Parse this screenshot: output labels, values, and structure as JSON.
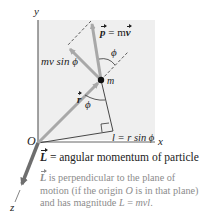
{
  "diagram": {
    "axes": {
      "x_label": "x",
      "y_label": "y",
      "z_label": "z",
      "origin_label": "O"
    },
    "particle_label": "m",
    "labels": {
      "momentum_lhs": "p",
      "momentum_eq": " = m",
      "momentum_rhs": "v",
      "perp_component": "mv sin ϕ",
      "angle_upper": "ϕ",
      "angle_lower": "ϕ",
      "position_vector": "r",
      "lever_arm_l": "l",
      "lever_arm_eq": " = r sin ϕ"
    },
    "colors": {
      "plane_fill": "#efefef",
      "arrow_gray": "#a8a8a8",
      "L_arrow": "#6e6e6e",
      "line": "#333333",
      "caption_gray": "#8c8c8c"
    }
  },
  "caption": {
    "main_symbol": "L",
    "main_text": " = angular momentum of particle",
    "sub_symbol": "L",
    "sub_line1": " is perpendicular to the plane of",
    "sub_line2_a": "motion (if the origin ",
    "sub_line2_O": "O",
    "sub_line2_b": " is in that plane)",
    "sub_line3_a": "and has magnitude ",
    "sub_line3_L": "L",
    "sub_line3_eq": " = ",
    "sub_line3_mvl": "mvl",
    "sub_line3_end": "."
  }
}
